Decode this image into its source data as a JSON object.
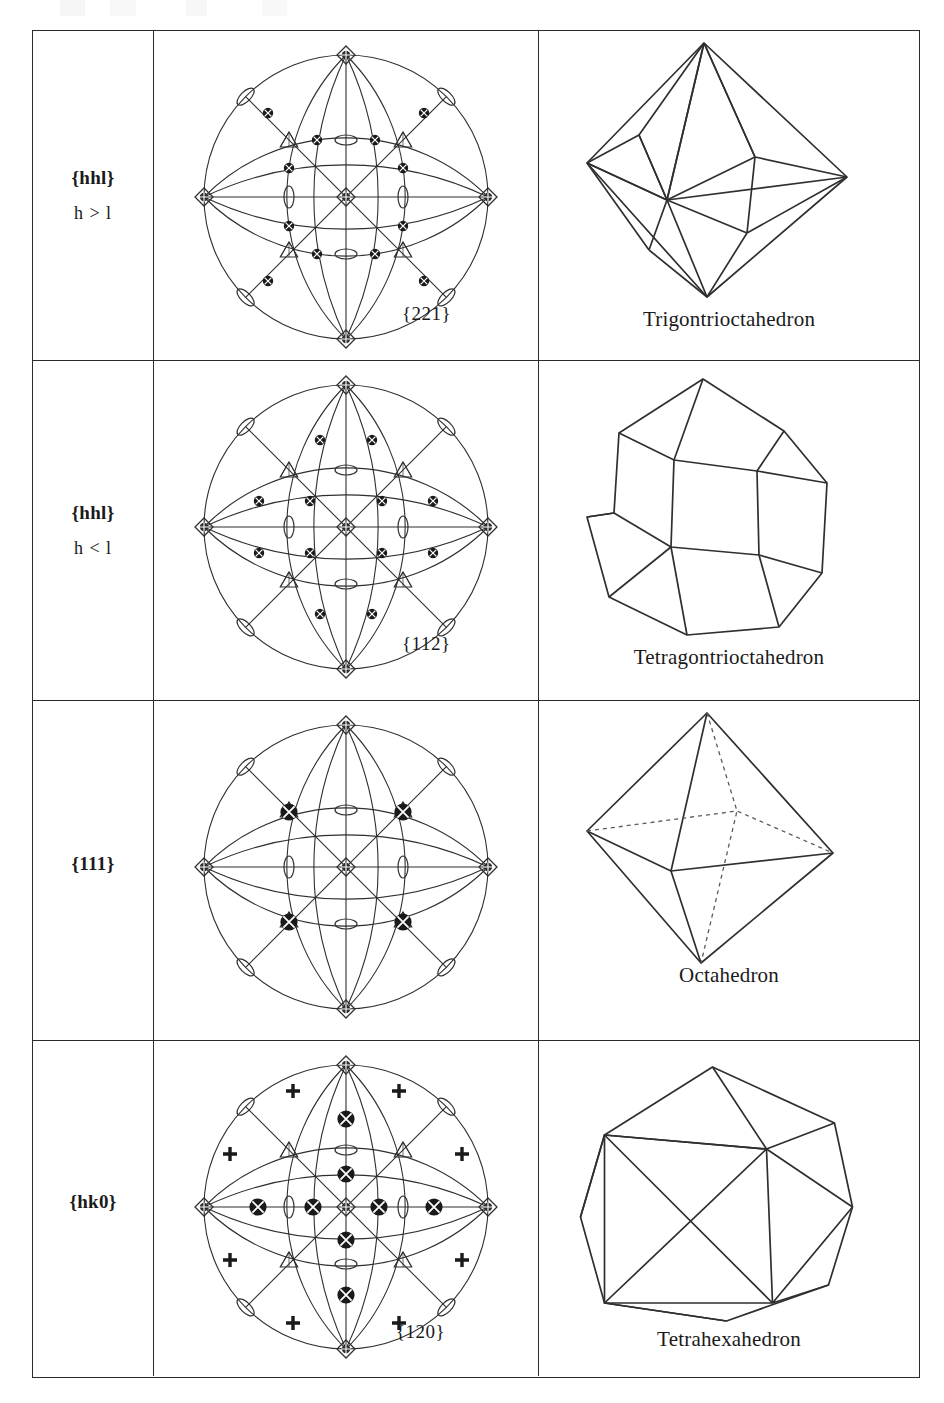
{
  "figure": {
    "kind": "crystal-forms-table",
    "columns": [
      "form-symbol",
      "stereogram",
      "crystal-form-drawing"
    ],
    "point_group": "m3m"
  },
  "rows": [
    {
      "symbol": "{hhl}",
      "condition": "h > l",
      "stereogram_label": "{221}",
      "solid_name": "Trigontrioctahedron",
      "pole_count": 24,
      "pole_size": "small"
    },
    {
      "symbol": "{hhl}",
      "condition": "h < l",
      "stereogram_label": "{112}",
      "solid_name": "Tetragontrioctahedron",
      "pole_count": 24,
      "pole_size": "small"
    },
    {
      "symbol": "{111}",
      "condition": "",
      "stereogram_label": "",
      "solid_name": "Octahedron",
      "pole_count": 8,
      "pole_size": "large"
    },
    {
      "symbol": "{hk0}",
      "condition": "",
      "stereogram_label": "{120}",
      "solid_name": "Tetrahexahedron",
      "pole_count": 24,
      "pole_size": "large"
    }
  ],
  "symmetry_symbols": {
    "fourfold": "filled-square-lens",
    "threefold": "triangle",
    "twofold": "lens-ellipse",
    "pole_upper": "filled-circle",
    "pole_lower": "plus-cross"
  },
  "colors": {
    "ink": "#1a1a1a",
    "rule": "#2b2b2b",
    "line": "#2f2f2f",
    "paper": "#ffffff"
  }
}
